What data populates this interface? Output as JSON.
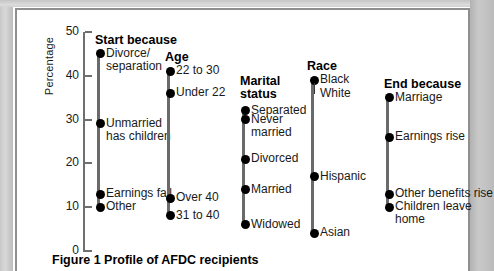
{
  "figure": {
    "caption": "Figure 1 Profile of AFDC recipients",
    "axis_title": "Percentage"
  },
  "chart_data": {
    "type": "scatter",
    "title": "Figure 1 Profile of AFDC recipients",
    "xlabel": "",
    "ylabel": "Percentage",
    "ylim": [
      0,
      50
    ],
    "yticks": [
      0,
      10,
      20,
      30,
      40,
      50
    ],
    "grid": false,
    "legend": "none",
    "note": "Five dot-plot columns; each column is one categorical variable, dots mark the percentage of AFDC recipients in each category.",
    "groups": [
      {
        "name": "Start because",
        "points": [
          {
            "label": "Divorce/\nseparation",
            "value": 45
          },
          {
            "label": "Unmarried\nhas children",
            "value": 29
          },
          {
            "label": "Earnings fall",
            "value": 13
          },
          {
            "label": "Other",
            "value": 10
          }
        ]
      },
      {
        "name": "Age",
        "points": [
          {
            "label": "22 to 30",
            "value": 41
          },
          {
            "label": "Under 22",
            "value": 36
          },
          {
            "label": "Over 40",
            "value": 12
          },
          {
            "label": "31 to 40",
            "value": 8
          }
        ]
      },
      {
        "name": "Marital\nstatus",
        "points": [
          {
            "label": "Separated",
            "value": 32
          },
          {
            "label": "Never\nmarried",
            "value": 30
          },
          {
            "label": "Divorced",
            "value": 21
          },
          {
            "label": "Married",
            "value": 14
          },
          {
            "label": "Widowed",
            "value": 6
          }
        ]
      },
      {
        "name": "Race",
        "points": [
          {
            "label": "Black",
            "value": 39
          },
          {
            "label": "White",
            "value": 39
          },
          {
            "label": "Hispanic",
            "value": 17
          },
          {
            "label": "Asian",
            "value": 4
          }
        ]
      },
      {
        "name": "End because",
        "points": [
          {
            "label": "Marriage",
            "value": 35
          },
          {
            "label": "Earnings rise",
            "value": 26
          },
          {
            "label": "Other benefits rise",
            "value": 13
          },
          {
            "label": "Children leave\nhome",
            "value": 10
          }
        ]
      }
    ]
  }
}
